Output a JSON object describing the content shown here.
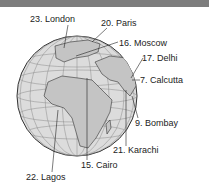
{
  "header": {
    "bar_color": "#7d7d7d"
  },
  "diagram": {
    "type": "globe-city-labels",
    "globe": {
      "fill": "#d9d9d9",
      "land_fill": "#bfbfbf",
      "outline": "#333333"
    },
    "cities": [
      {
        "rank": "23",
        "name": "London",
        "label": "23. London"
      },
      {
        "rank": "20",
        "name": "Paris",
        "label": "20. Paris"
      },
      {
        "rank": "16",
        "name": "Moscow",
        "label": "16. Moscow"
      },
      {
        "rank": "17",
        "name": "Delhi",
        "label": "17. Delhi"
      },
      {
        "rank": "7",
        "name": "Calcutta",
        "label": "7. Calcutta"
      },
      {
        "rank": "9",
        "name": "Bombay",
        "label": "9. Bombay"
      },
      {
        "rank": "21",
        "name": "Karachi",
        "label": "21. Karachi"
      },
      {
        "rank": "15",
        "name": "Cairo",
        "label": "15. Cairo"
      },
      {
        "rank": "22",
        "name": "Lagos",
        "label": "22. Lagos"
      }
    ]
  }
}
